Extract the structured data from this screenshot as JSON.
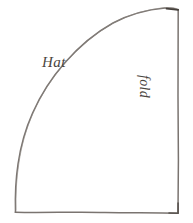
{
  "diagram": {
    "background_color": "#ffffff",
    "stroke_color": "#7a7470",
    "label_color": "#4a4540",
    "labels": {
      "curve": "Hat",
      "right_edge": "fold"
    },
    "edges": {
      "curve_name": "hat-curve",
      "right_edge_name": "fold-edge",
      "bottom_edge_name": "bottom-edge"
    },
    "geometry": {
      "apex": [
        178,
        10
      ],
      "bottom_right": [
        178,
        213
      ],
      "bottom_left": [
        15,
        212
      ]
    }
  }
}
